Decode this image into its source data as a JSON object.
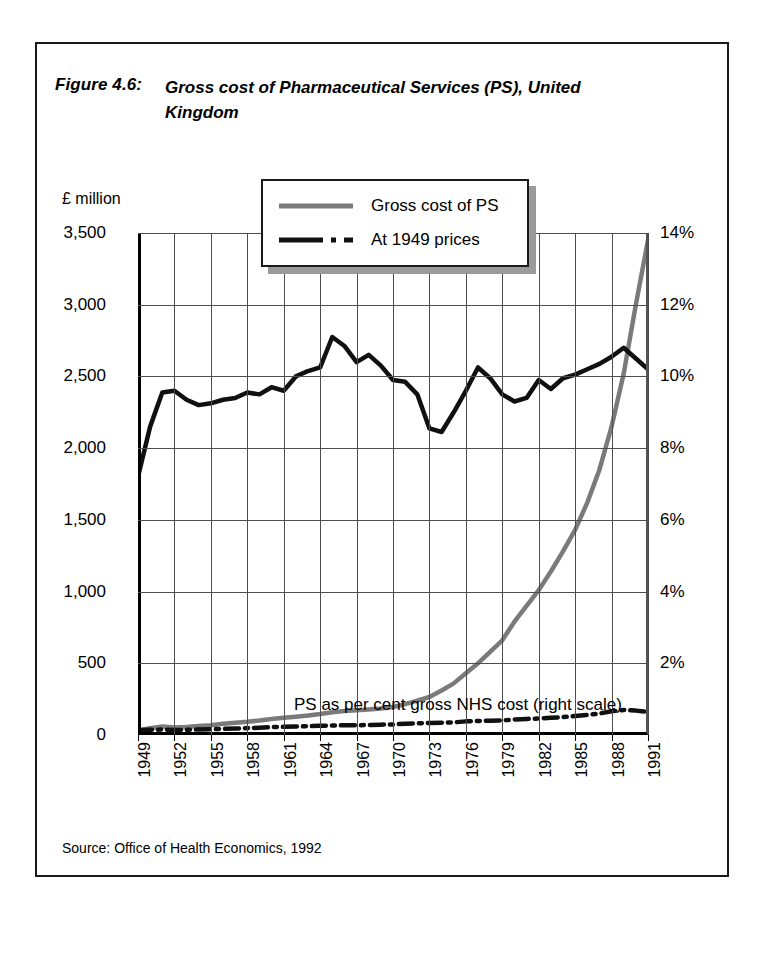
{
  "figure": {
    "label": "Figure 4.6:",
    "title": "Gross cost of Pharmaceutical Services (PS), United Kingdom",
    "source": "Source: Office of Health Economics, 1992"
  },
  "legend": {
    "items": [
      {
        "label": "Gross cost of PS",
        "style": "solid",
        "color": "#7a7a7a"
      },
      {
        "label": "At 1949 prices",
        "style": "dash-dot",
        "color": "#101010"
      }
    ]
  },
  "annotation": "PS as per cent gross NHS cost (right scale)",
  "colors": {
    "gross_cost_line": "#7a7a7a",
    "at_1949_prices_line": "#101010",
    "percent_line": "#101010",
    "grid": "#4d4d4d",
    "axis": "#000000",
    "legend_shadow": "#9a9a9a"
  },
  "chart_data": {
    "type": "line",
    "title": "Gross cost of Pharmaceutical Services (PS), United Kingdom",
    "subtitle": "",
    "xlabel": "",
    "ylabel": "£ million",
    "y2label": "",
    "xlim": [
      1949,
      1991
    ],
    "ylim": [
      0,
      3500
    ],
    "y2lim": [
      0,
      14
    ],
    "grid": true,
    "legend_position": "top-center",
    "y_ticklabels": [
      "0",
      "500",
      "1,000",
      "1,500",
      "2,000",
      "2,500",
      "3,000",
      "3,500"
    ],
    "y_tickvalues": [
      0,
      500,
      1000,
      1500,
      2000,
      2500,
      3000,
      3500
    ],
    "y2_ticklabels": [
      "2%",
      "4%",
      "6%",
      "8%",
      "10%",
      "12%",
      "14%"
    ],
    "y2_tickvalues": [
      2,
      4,
      6,
      8,
      10,
      12,
      14
    ],
    "x_ticklabels": [
      "1949",
      "1952",
      "1955",
      "1958",
      "1961",
      "1964",
      "1967",
      "1970",
      "1973",
      "1976",
      "1979",
      "1982",
      "1985",
      "1988",
      "1991"
    ],
    "x_tickvalues": [
      1949,
      1952,
      1955,
      1958,
      1961,
      1964,
      1967,
      1970,
      1973,
      1976,
      1979,
      1982,
      1985,
      1988,
      1991
    ],
    "x": [
      1949,
      1950,
      1951,
      1952,
      1953,
      1954,
      1955,
      1956,
      1957,
      1958,
      1959,
      1960,
      1961,
      1962,
      1963,
      1964,
      1965,
      1966,
      1967,
      1968,
      1969,
      1970,
      1971,
      1972,
      1973,
      1974,
      1975,
      1976,
      1977,
      1978,
      1979,
      1980,
      1981,
      1982,
      1983,
      1984,
      1985,
      1986,
      1987,
      1988,
      1989,
      1990,
      1991
    ],
    "series": [
      {
        "name": "Gross cost of PS",
        "axis": "left",
        "unit": "£ million",
        "color": "#7a7a7a",
        "style": "solid",
        "values": [
          33,
          48,
          60,
          52,
          56,
          62,
          68,
          78,
          85,
          92,
          101,
          112,
          120,
          128,
          136,
          146,
          158,
          168,
          172,
          178,
          185,
          195,
          215,
          240,
          265,
          310,
          360,
          430,
          500,
          580,
          660,
          790,
          900,
          1010,
          1140,
          1280,
          1430,
          1620,
          1850,
          2150,
          2520,
          3000,
          3450
        ]
      },
      {
        "name": "At 1949 prices",
        "axis": "left",
        "unit": "£ million",
        "color": "#101010",
        "style": "dash-dot",
        "values": [
          33,
          36,
          38,
          34,
          36,
          38,
          40,
          43,
          45,
          48,
          51,
          55,
          57,
          59,
          61,
          64,
          66,
          68,
          68,
          70,
          72,
          74,
          78,
          82,
          84,
          86,
          88,
          95,
          98,
          100,
          102,
          108,
          112,
          115,
          120,
          125,
          132,
          140,
          150,
          165,
          175,
          170,
          160
        ]
      },
      {
        "name": "PS as per cent gross NHS cost",
        "axis": "right",
        "unit": "%",
        "color": "#101010",
        "style": "solid",
        "values": [
          7.2,
          8.6,
          9.55,
          9.6,
          9.35,
          9.2,
          9.25,
          9.35,
          9.4,
          9.55,
          9.5,
          9.7,
          9.6,
          10.0,
          10.15,
          10.25,
          11.1,
          10.85,
          10.4,
          10.6,
          10.3,
          9.9,
          9.85,
          9.5,
          8.55,
          8.45,
          9.0,
          9.6,
          10.25,
          9.95,
          9.5,
          9.3,
          9.4,
          9.9,
          9.65,
          9.95,
          10.05,
          10.2,
          10.35,
          10.55,
          10.8,
          10.5,
          10.2
        ]
      }
    ]
  }
}
